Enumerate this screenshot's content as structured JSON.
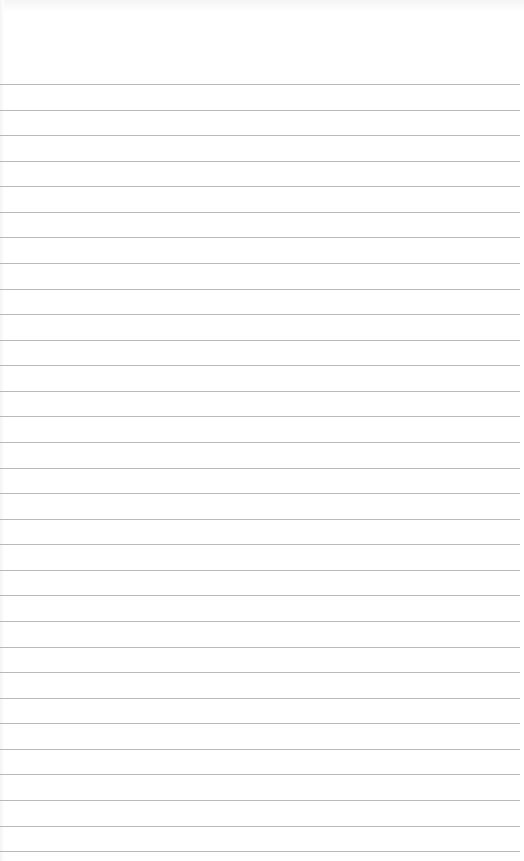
{
  "page": {
    "type": "lined-paper",
    "background_color": "#ffffff",
    "line_color": "#b9b9b9",
    "line_count": 31,
    "first_line_y": 84,
    "line_spacing": 25.57,
    "line_width": 520
  }
}
